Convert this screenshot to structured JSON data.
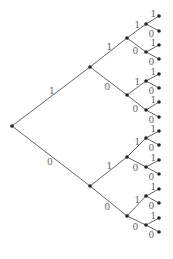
{
  "diagram": {
    "type": "binary-tree",
    "depth": 4,
    "edge_labels": {
      "up": "1",
      "down": "0"
    },
    "root": [
      12,
      126
    ],
    "levels": [
      {
        "x": 90,
        "ys": [
          67,
          186
        ],
        "lblx": [
          45,
          40
        ],
        "lbly": [
          102,
          160
        ]
      },
      {
        "x": 127,
        "ys": [
          38,
          95,
          157,
          216
        ]
      },
      {
        "x": 146,
        "ys": [
          24,
          52,
          81,
          110,
          138,
          167,
          196,
          225
        ]
      },
      {
        "x": 159,
        "ys": [
          16,
          31,
          45,
          59,
          74,
          88,
          102,
          117,
          131,
          145,
          160,
          174,
          189,
          203,
          218,
          232
        ]
      }
    ]
  }
}
